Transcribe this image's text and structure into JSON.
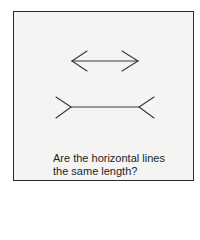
{
  "figure": {
    "caption_line1": "Are the horizontal lines",
    "caption_line2": "the same length?",
    "colors": {
      "frame": "#2a2a2a",
      "background": "#f4f4f2",
      "lines": "#333333"
    }
  }
}
